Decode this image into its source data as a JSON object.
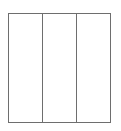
{
  "diagram": {
    "type": "three-column-rectangle",
    "columns": 3,
    "border_color": "#6e6e6e",
    "background_color": "#ffffff",
    "panels": [
      {
        "index": 0,
        "label": ""
      },
      {
        "index": 1,
        "label": ""
      },
      {
        "index": 2,
        "label": ""
      }
    ]
  }
}
